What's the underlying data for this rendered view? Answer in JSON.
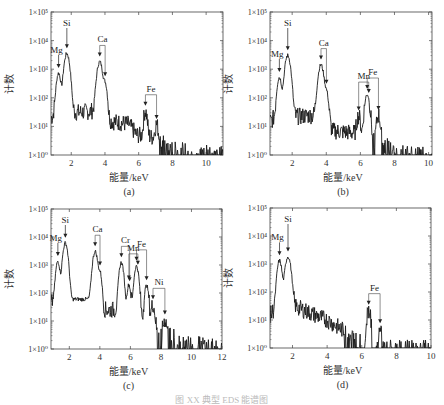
{
  "figure": {
    "caption": "图 XX 典型 EDS 能谱图",
    "y_axis_label": "计数",
    "x_axis_label": "能量/keV",
    "line_color": "#1a1a1a",
    "axis_color": "#444444"
  },
  "chart_data": [
    {
      "type": "line",
      "panel": "(a)",
      "title": "",
      "xlabel": "能量/keV",
      "ylabel": "计数",
      "yscale": "log",
      "ylim": [
        1,
        100000
      ],
      "xlim": [
        0.8,
        11
      ],
      "xticks": [
        2,
        4,
        6,
        8,
        10
      ],
      "yticks": [
        "1×10⁰",
        "1×10¹",
        "1×10²",
        "1×10³",
        "1×10⁴",
        "1×10⁵"
      ],
      "grid": false,
      "frame": {
        "x": 51,
        "y": 12,
        "w": 172,
        "h": 143
      },
      "baseline": [
        [
          0.8,
          20
        ],
        [
          1.0,
          25
        ],
        [
          2.2,
          30
        ],
        [
          3.4,
          35
        ],
        [
          4.4,
          15
        ],
        [
          5.4,
          12
        ],
        [
          5.9,
          5
        ],
        [
          7.0,
          4
        ],
        [
          8.0,
          1.5
        ],
        [
          11,
          1
        ]
      ],
      "peaks": [
        {
          "element": "Mg",
          "energy": 1.25,
          "counts": 700,
          "width": 0.1
        },
        {
          "element": "Si",
          "energy": 1.74,
          "counts": 3500,
          "width": 0.12
        },
        {
          "element": "Ca",
          "energy": 3.69,
          "counts": 1800,
          "width": 0.12
        },
        {
          "element": "Ca",
          "energy": 4.01,
          "counts": 300,
          "width": 0.09
        },
        {
          "element": "Fe",
          "energy": 6.4,
          "counts": 30,
          "width": 0.08
        },
        {
          "element": "Fe",
          "energy": 7.06,
          "counts": 8,
          "width": 0.08
        }
      ],
      "annotations": [
        {
          "label": "Mg",
          "energies": [
            1.25
          ]
        },
        {
          "label": "Si",
          "energies": [
            1.74
          ]
        },
        {
          "label": "Ca",
          "energies": [
            3.69,
            4.01
          ]
        },
        {
          "label": "Fe",
          "energies": [
            6.4,
            7.06
          ]
        }
      ]
    },
    {
      "type": "line",
      "panel": "(b)",
      "title": "",
      "xlabel": "能量/keV",
      "ylabel": "计数",
      "yscale": "log",
      "ylim": [
        1,
        100000
      ],
      "xlim": [
        0.7,
        10.2
      ],
      "xticks": [
        2,
        4,
        6,
        8,
        10
      ],
      "yticks": [
        "1×10⁰",
        "1×10¹",
        "1×10²",
        "1×10³",
        "1×10⁴",
        "1×10⁵"
      ],
      "grid": false,
      "frame": {
        "x": 270,
        "y": 12,
        "w": 162,
        "h": 143
      },
      "baseline": [
        [
          0.7,
          15
        ],
        [
          1.0,
          20
        ],
        [
          2.2,
          22
        ],
        [
          3.4,
          25
        ],
        [
          4.4,
          7
        ],
        [
          5.6,
          6
        ],
        [
          6.0,
          3
        ],
        [
          7.6,
          2
        ],
        [
          8.0,
          1.2
        ],
        [
          10.2,
          1
        ]
      ],
      "peaks": [
        {
          "element": "Mg",
          "energy": 1.25,
          "counts": 500,
          "width": 0.1
        },
        {
          "element": "Si",
          "energy": 1.74,
          "counts": 3000,
          "width": 0.12
        },
        {
          "element": "Ca",
          "energy": 3.69,
          "counts": 1400,
          "width": 0.12
        },
        {
          "element": "Ca",
          "energy": 4.01,
          "counts": 150,
          "width": 0.09
        },
        {
          "element": "Mn",
          "energy": 5.9,
          "counts": 20,
          "width": 0.09
        },
        {
          "element": "Fe",
          "energy": 6.4,
          "counts": 130,
          "width": 0.11
        },
        {
          "element": "Fe",
          "energy": 7.06,
          "counts": 22,
          "width": 0.09
        }
      ],
      "annotations": [
        {
          "label": "Mg",
          "energies": [
            1.25
          ]
        },
        {
          "label": "Si",
          "energies": [
            1.74
          ]
        },
        {
          "label": "Ca",
          "energies": [
            3.69,
            4.01
          ]
        },
        {
          "label": "Mn",
          "energies": [
            5.9,
            6.49
          ]
        },
        {
          "label": "Fe",
          "energies": [
            6.4,
            7.06
          ]
        }
      ]
    },
    {
      "type": "line",
      "panel": "(c)",
      "title": "",
      "xlabel": "能量/keV",
      "ylabel": "计数",
      "yscale": "log",
      "ylim": [
        1,
        100000
      ],
      "xlim": [
        0.8,
        12
      ],
      "xticks": [
        2,
        4,
        6,
        8,
        10,
        12
      ],
      "yticks": [
        "1×10⁰",
        "1×10¹",
        "1×10²",
        "1×10³",
        "1×10⁴",
        "1×10⁵"
      ],
      "grid": false,
      "frame": {
        "x": 51,
        "y": 209,
        "w": 171,
        "h": 140
      },
      "baseline": [
        [
          0.8,
          40
        ],
        [
          1.0,
          60
        ],
        [
          2.2,
          60
        ],
        [
          3.4,
          60
        ],
        [
          4.3,
          25
        ],
        [
          5.0,
          25
        ],
        [
          6.5,
          15
        ],
        [
          7.6,
          3
        ],
        [
          8.5,
          3
        ],
        [
          10,
          1.6
        ],
        [
          12,
          1.2
        ]
      ],
      "peaks": [
        {
          "element": "Mg",
          "energy": 1.25,
          "counts": 1300,
          "width": 0.1
        },
        {
          "element": "Si",
          "energy": 1.74,
          "counts": 6000,
          "width": 0.12
        },
        {
          "element": "Ca",
          "energy": 3.69,
          "counts": 3000,
          "width": 0.12
        },
        {
          "element": "Ca",
          "energy": 4.01,
          "counts": 500,
          "width": 0.09
        },
        {
          "element": "Cr",
          "energy": 5.41,
          "counts": 1200,
          "width": 0.11
        },
        {
          "element": "Mn",
          "energy": 5.9,
          "counts": 180,
          "width": 0.09
        },
        {
          "element": "Fe",
          "energy": 6.4,
          "counts": 900,
          "width": 0.11
        },
        {
          "element": "Fe",
          "energy": 7.06,
          "counts": 180,
          "width": 0.1
        },
        {
          "element": "Ni",
          "energy": 7.48,
          "counts": 35,
          "width": 0.1
        },
        {
          "element": "Ni",
          "energy": 8.26,
          "counts": 8,
          "width": 0.1
        }
      ],
      "annotations": [
        {
          "label": "Mg",
          "energies": [
            1.25
          ]
        },
        {
          "label": "Si",
          "energies": [
            1.74
          ]
        },
        {
          "label": "Ca",
          "energies": [
            3.69,
            4.01
          ]
        },
        {
          "label": "Cr",
          "energies": [
            5.41,
            5.95
          ]
        },
        {
          "label": "Mn",
          "energies": [
            5.9,
            6.49
          ]
        },
        {
          "label": "Fe",
          "energies": [
            6.4,
            7.06
          ]
        },
        {
          "label": "Ni",
          "energies": [
            7.48,
            8.26
          ]
        }
      ]
    },
    {
      "type": "line",
      "panel": "(d)",
      "title": "",
      "xlabel": "能量/keV",
      "ylabel": "计数",
      "yscale": "log",
      "ylim": [
        1,
        100000
      ],
      "xlim": [
        0.7,
        10
      ],
      "xticks": [
        2,
        4,
        6,
        8,
        10
      ],
      "yticks": [
        "1×10⁰",
        "1×10¹",
        "1×10²",
        "1×10³",
        "1×10⁴",
        "1×10⁵"
      ],
      "grid": false,
      "frame": {
        "x": 270,
        "y": 208,
        "w": 161,
        "h": 140
      },
      "baseline": [
        [
          0.7,
          15
        ],
        [
          1.0,
          25
        ],
        [
          2.2,
          30
        ],
        [
          3.0,
          18
        ],
        [
          4.0,
          10
        ],
        [
          5.0,
          4
        ],
        [
          5.8,
          2
        ],
        [
          6.2,
          1
        ],
        [
          10,
          1
        ]
      ],
      "peaks": [
        {
          "element": "Mg",
          "energy": 1.25,
          "counts": 1300,
          "width": 0.1
        },
        {
          "element": "Si",
          "energy": 1.74,
          "counts": 1800,
          "width": 0.12
        },
        {
          "element": "Fe",
          "energy": 6.4,
          "counts": 22,
          "width": 0.09
        },
        {
          "element": "Fe",
          "energy": 7.06,
          "counts": 4,
          "width": 0.07
        }
      ],
      "annotations": [
        {
          "label": "Mg",
          "energies": [
            1.25
          ]
        },
        {
          "label": "Si",
          "energies": [
            1.74
          ]
        },
        {
          "label": "Fe",
          "energies": [
            6.4,
            7.06
          ]
        }
      ]
    }
  ]
}
